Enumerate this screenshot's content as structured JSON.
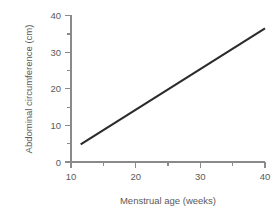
{
  "chart_data": {
    "type": "line",
    "title": "",
    "xlabel": "Menstrual age (weeks)",
    "ylabel": "Abdominal circumference (cm)",
    "xlim": [
      10,
      40
    ],
    "ylim": [
      0,
      40
    ],
    "grid": false,
    "legend": false,
    "x_major_ticks": [
      10,
      20,
      30,
      40
    ],
    "x_major_tick_labels": [
      "10",
      "20",
      "30",
      "40"
    ],
    "x_minor_ticks": [
      15,
      25,
      35
    ],
    "y_major_ticks": [
      0,
      10,
      20,
      30,
      40
    ],
    "y_major_tick_labels": [
      "0",
      "10",
      "20",
      "30",
      "40"
    ],
    "y_minor_ticks": [
      5,
      15,
      25,
      35
    ],
    "series": [
      {
        "name": "Abdominal circumference",
        "color": "#2b2b2b",
        "x": [
          11.5,
          40.0
        ],
        "values": [
          4.8,
          36.5
        ]
      }
    ]
  },
  "figure": {
    "background_color": "#ffffff",
    "axis_color": "#8a8a8a",
    "text_color": "#5a5a5a",
    "line_color": "#2b2b2b"
  }
}
